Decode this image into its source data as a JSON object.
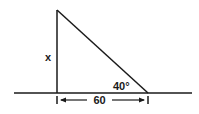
{
  "diagram": {
    "type": "right-triangle",
    "labels": {
      "side_vertical": "x",
      "side_horizontal": "60",
      "angle": "40°"
    },
    "colors": {
      "stroke": "#1a1a1a",
      "background": "#ffffff"
    }
  }
}
